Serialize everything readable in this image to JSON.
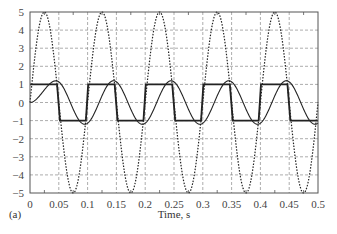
{
  "chart_data": {
    "type": "line",
    "title": "",
    "panel_label": "(a)",
    "xlabel": "Time, s",
    "ylabel": "",
    "xlim": [
      0,
      0.5
    ],
    "ylim": [
      -5,
      5
    ],
    "grid": true,
    "x_ticks": [
      0,
      0.05,
      0.1,
      0.15,
      0.2,
      0.25,
      0.3,
      0.35,
      0.4,
      0.45,
      0.5
    ],
    "x_tick_labels": [
      "0",
      "0.05",
      "0.1",
      "0.15",
      "0.2",
      "0.25",
      "0.3",
      "0.35",
      "0.4",
      "0.45",
      "0.5"
    ],
    "y_ticks": [
      5,
      4,
      3,
      2,
      1,
      0,
      -1,
      -2,
      -3,
      -4,
      -5
    ],
    "y_tick_labels": [
      "5",
      "4",
      "3",
      "2",
      "1",
      "0",
      "−1",
      "−2",
      "−3",
      "−4",
      "−5"
    ],
    "legend": null,
    "series": [
      {
        "name": "sinusoidal input (dotted)",
        "style": "dotted",
        "description": "5*sin(2*pi*10*t)",
        "x": [
          0,
          0.025,
          0.05,
          0.075,
          0.1,
          0.125,
          0.15,
          0.175,
          0.2,
          0.225,
          0.25,
          0.275,
          0.3,
          0.325,
          0.35,
          0.375,
          0.4,
          0.425,
          0.45,
          0.475,
          0.5
        ],
        "values": [
          0,
          5,
          0,
          -5,
          0,
          5,
          0,
          -5,
          0,
          5,
          0,
          -5,
          0,
          5,
          0,
          -5,
          0,
          5,
          0,
          -5,
          0
        ]
      },
      {
        "name": "square wave (thick solid)",
        "style": "solid-thick",
        "x": [
          0,
          0.047,
          0.052,
          0.097,
          0.101,
          0.147,
          0.152,
          0.197,
          0.201,
          0.247,
          0.252,
          0.297,
          0.301,
          0.347,
          0.352,
          0.397,
          0.401,
          0.447,
          0.452,
          0.5
        ],
        "values": [
          1,
          1,
          -1,
          -1,
          1,
          1,
          -1,
          -1,
          1,
          1,
          -1,
          -1,
          1,
          1,
          -1,
          -1,
          1,
          1,
          -1,
          -1
        ]
      },
      {
        "name": "filtered response (thin solid)",
        "style": "solid-thin",
        "x": [
          0,
          0.01,
          0.02,
          0.03,
          0.045,
          0.07,
          0.095,
          0.12,
          0.145,
          0.17,
          0.195,
          0.22,
          0.245,
          0.27,
          0.295,
          0.32,
          0.345,
          0.37,
          0.395,
          0.42,
          0.445,
          0.47,
          0.495,
          0.5
        ],
        "values": [
          0,
          0.1,
          0.45,
          0.85,
          1.2,
          0,
          -1.2,
          0,
          1.2,
          0,
          -1.2,
          0,
          1.2,
          0,
          -1.2,
          0,
          1.2,
          0,
          -1.2,
          0,
          1.2,
          0,
          -1.2,
          -1.15
        ]
      }
    ]
  },
  "colors": {
    "line": "#222222",
    "grid": "#8a8a8a",
    "axis": "#555555",
    "background": "#ffffff"
  }
}
